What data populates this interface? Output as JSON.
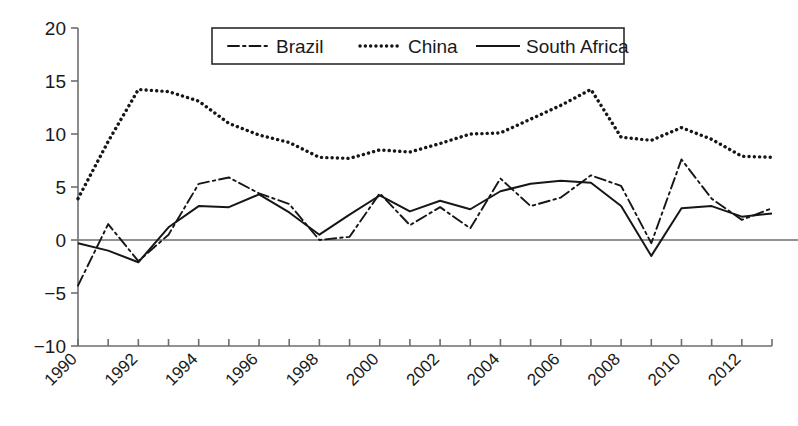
{
  "chart_data": {
    "type": "line",
    "title": "",
    "xlabel": "",
    "ylabel": "",
    "xlim": [
      1990,
      2013
    ],
    "ylim": [
      -10,
      20
    ],
    "grid": false,
    "legend_position": "top-center",
    "y_ticks": [
      "20",
      "15",
      "10",
      "5",
      "0",
      "−5",
      "−10"
    ],
    "y_tick_values": [
      20,
      15,
      10,
      5,
      0,
      -5,
      -10
    ],
    "x_ticks": [
      "1990",
      "1992",
      "1994",
      "1996",
      "1998",
      "2000",
      "2002",
      "2004",
      "2006",
      "2008",
      "2010",
      "2012"
    ],
    "x_tick_values": [
      1990,
      1992,
      1994,
      1996,
      1998,
      2000,
      2002,
      2004,
      2006,
      2008,
      2010,
      2012
    ],
    "x": [
      1990,
      1991,
      1992,
      1993,
      1994,
      1995,
      1996,
      1997,
      1998,
      1999,
      2000,
      2001,
      2002,
      2003,
      2004,
      2005,
      2006,
      2007,
      2008,
      2009,
      2010,
      2011,
      2012,
      2013
    ],
    "series": [
      {
        "name": "Brazil",
        "style": "dash-dot",
        "color": "#161616",
        "values": [
          -4.3,
          1.5,
          -2.0,
          0.5,
          5.3,
          5.9,
          4.4,
          3.4,
          0.0,
          0.3,
          4.4,
          1.4,
          3.1,
          1.1,
          5.8,
          3.2,
          4.0,
          6.1,
          5.1,
          -0.3,
          7.6,
          3.9,
          1.9,
          3.0
        ]
      },
      {
        "name": "China",
        "style": "dotted",
        "color": "#161616",
        "values": [
          3.9,
          9.3,
          14.2,
          14.0,
          13.1,
          11.0,
          9.9,
          9.2,
          7.8,
          7.7,
          8.5,
          8.3,
          9.1,
          10.0,
          10.1,
          11.4,
          12.7,
          14.2,
          9.7,
          9.4,
          10.6,
          9.5,
          7.9,
          7.8
        ]
      },
      {
        "name": "South Africa",
        "style": "solid",
        "color": "#161616",
        "values": [
          -0.3,
          -1.0,
          -2.1,
          1.2,
          3.2,
          3.1,
          4.3,
          2.6,
          0.5,
          2.4,
          4.2,
          2.7,
          3.7,
          2.9,
          4.6,
          5.3,
          5.6,
          5.4,
          3.2,
          -1.5,
          3.0,
          3.2,
          2.2,
          2.5
        ]
      }
    ]
  },
  "legend": {
    "entries": [
      {
        "label": "Brazil",
        "marker": "dash-dot-line-icon"
      },
      {
        "label": "China",
        "marker": "dotted-line-icon"
      },
      {
        "label": "South Africa",
        "marker": "solid-line-icon"
      }
    ]
  }
}
